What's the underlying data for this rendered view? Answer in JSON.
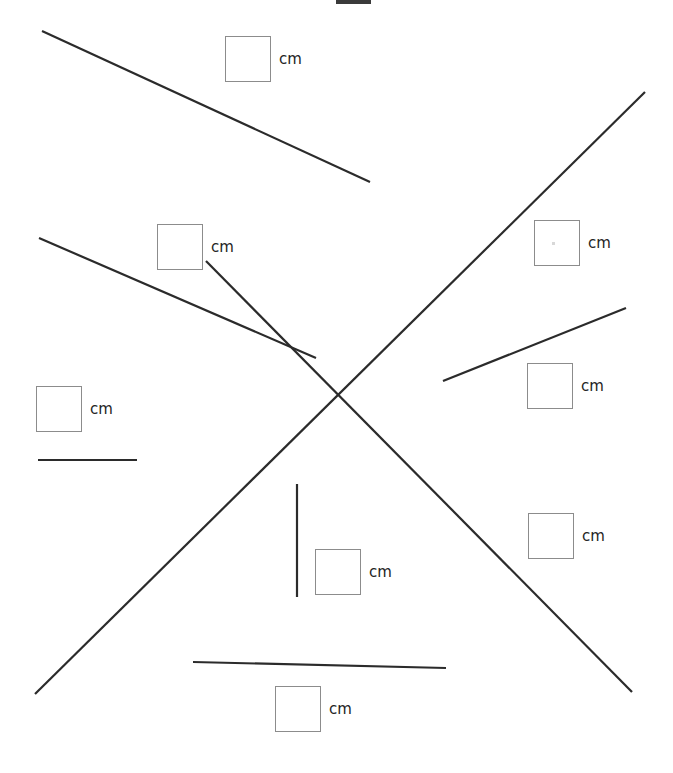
{
  "page": {
    "width": 673,
    "height": 773,
    "background": "#ffffff"
  },
  "style": {
    "line_color": "#2b2b2b",
    "line_width": 2.2,
    "box_border_color": "#8c8c8c",
    "box_fill": "#ffffff",
    "label_color": "#242424",
    "label_font_size": 15,
    "artifact_color": "#3a3a3a"
  },
  "lines": [
    {
      "name": "line-top-left-descending",
      "x1": 42,
      "y1": 31,
      "x2": 370,
      "y2": 182,
      "length_px": 361
    },
    {
      "name": "line-long-diagonal-ascending",
      "x1": 35,
      "y1": 694,
      "x2": 645,
      "y2": 92,
      "length_px": 857
    },
    {
      "name": "line-long-diagonal-descending",
      "x1": 206,
      "y1": 261,
      "x2": 632,
      "y2": 692,
      "length_px": 606
    },
    {
      "name": "line-second-descending",
      "x1": 39,
      "y1": 238,
      "x2": 316,
      "y2": 358,
      "length_px": 302
    },
    {
      "name": "line-short-horizontal-left",
      "x1": 38,
      "y1": 460,
      "x2": 137,
      "y2": 460,
      "length_px": 99
    },
    {
      "name": "line-short-ascending-right",
      "x1": 443,
      "y1": 381,
      "x2": 626,
      "y2": 308,
      "length_px": 197
    },
    {
      "name": "line-vertical-center",
      "x1": 297,
      "y1": 484,
      "x2": 297,
      "y2": 597,
      "length_px": 113
    },
    {
      "name": "line-bottom-horizontal",
      "x1": 193,
      "y1": 662,
      "x2": 446,
      "y2": 668,
      "length_px": 253
    }
  ],
  "answers": [
    {
      "name": "answer-1",
      "value": "",
      "placeholder": "",
      "unit": "cm",
      "left": 225,
      "top": 36,
      "box_width": 46,
      "box_height": 46
    },
    {
      "name": "answer-2",
      "value": "",
      "placeholder": "",
      "unit": "cm",
      "left": 157,
      "top": 224,
      "box_width": 46,
      "box_height": 46
    },
    {
      "name": "answer-3",
      "value": "",
      "placeholder": "",
      "unit": "cm",
      "left": 534,
      "top": 220,
      "box_width": 46,
      "box_height": 46
    },
    {
      "name": "answer-4",
      "value": "",
      "placeholder": "",
      "unit": "cm",
      "left": 36,
      "top": 386,
      "box_width": 46,
      "box_height": 46
    },
    {
      "name": "answer-5",
      "value": "",
      "placeholder": "",
      "unit": "cm",
      "left": 527,
      "top": 363,
      "box_width": 46,
      "box_height": 46
    },
    {
      "name": "answer-6",
      "value": "",
      "placeholder": "",
      "unit": "cm",
      "left": 528,
      "top": 513,
      "box_width": 46,
      "box_height": 46
    },
    {
      "name": "answer-7",
      "value": "",
      "placeholder": "",
      "unit": "cm",
      "left": 315,
      "top": 549,
      "box_width": 46,
      "box_height": 46
    },
    {
      "name": "answer-8",
      "value": "",
      "placeholder": "",
      "unit": "cm",
      "left": 275,
      "top": 686,
      "box_width": 46,
      "box_height": 46
    }
  ],
  "artifacts": [
    {
      "name": "clipped-bar-top",
      "left": 336,
      "top": 0,
      "width": 35,
      "height": 4
    }
  ],
  "artifact_dot": {
    "name": "stray-dot-in-answer-3",
    "left": 552,
    "top": 242,
    "size": 3
  }
}
